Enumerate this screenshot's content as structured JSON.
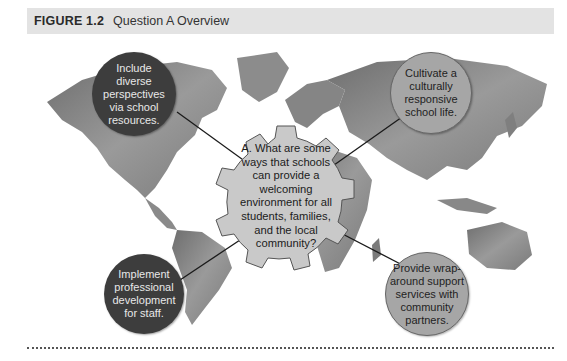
{
  "header": {
    "figure_label": "FIGURE 1.2",
    "title": "Question A Overview"
  },
  "center": {
    "text": "A. What are some ways that schools can provide a welcoming environment for all students, families, and the local community?",
    "shape": "gear"
  },
  "nodes": [
    {
      "position": "top-left",
      "text": "Include diverse perspectives via school resources.",
      "style": "dark"
    },
    {
      "position": "top-right",
      "text": "Cultivate a culturally responsive school life.",
      "style": "light"
    },
    {
      "position": "bottom-left",
      "text": "Implement professional development for staff.",
      "style": "dark"
    },
    {
      "position": "bottom-right",
      "text": "Provide wrap-around support services with community partners.",
      "style": "light"
    }
  ],
  "background": "world-map",
  "colors": {
    "header_bg": "#e3e3e3",
    "dark_circle": "#3d3d3d",
    "light_circle": "#a6a6a6",
    "gear": "#c9c9c9",
    "map": "#8a8a8a"
  }
}
